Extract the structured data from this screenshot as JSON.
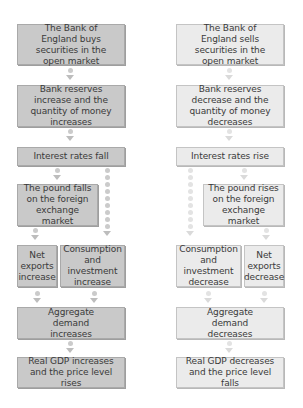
{
  "left_column": {
    "title": "Expansionary monetary policy",
    "boxes": [
      {
        "id": "buy",
        "text": "The Bank of England buys securities in the open market"
      },
      {
        "id": "reserves",
        "text": "Bank reserves increase and the quantity of money increases"
      },
      {
        "id": "interest",
        "text": "Interest rates fall"
      },
      {
        "id": "pound",
        "text": "The pound falls on the foreign exchange market"
      },
      {
        "id": "netexports",
        "text": "Net exports increase"
      },
      {
        "id": "consumption",
        "text": "Consumption and investment increase"
      },
      {
        "id": "ad",
        "text": "Aggregate demand increases"
      },
      {
        "id": "gdp",
        "text": "Real GDP increases and the price level rises"
      }
    ]
  },
  "right_column": {
    "title": "Contractionary monetary policy",
    "boxes": [
      {
        "id": "sell",
        "text": "The Bank of England sells securities in the open market"
      },
      {
        "id": "reserves",
        "text": "Bank reserves decrease and the quantity of money decreases"
      },
      {
        "id": "interest",
        "text": "Interest rates rise"
      },
      {
        "id": "pound",
        "text": "The pound rises on the foreign exchange market"
      },
      {
        "id": "consumption",
        "text": "Consumption and investment decrease"
      },
      {
        "id": "netexports",
        "text": "Net exports decrease"
      },
      {
        "id": "ad",
        "text": "Aggregate demand decreases"
      },
      {
        "id": "gdp",
        "text": "Real GDP decreases and the price level falls"
      }
    ]
  },
  "colors": {
    "left_box_fill": "#c9c9c9",
    "right_box_fill": "#ebebeb",
    "text": "#3a3a3a"
  }
}
